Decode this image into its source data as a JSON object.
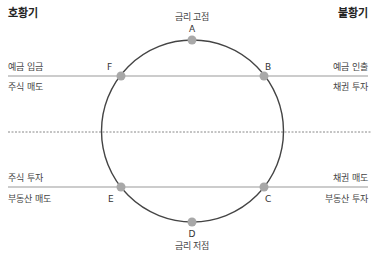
{
  "headers": {
    "left": "호황기",
    "right": "불황기"
  },
  "points": {
    "A": {
      "label": "A",
      "caption": "금리 고점"
    },
    "B": {
      "label": "B"
    },
    "C": {
      "label": "C"
    },
    "D": {
      "label": "D",
      "caption": "금리 저점"
    },
    "E": {
      "label": "E"
    },
    "F": {
      "label": "F"
    }
  },
  "upper_line": {
    "left_above": "예금 입금",
    "left_below": "주식 매도",
    "right_above": "예금 인출",
    "right_below": "채권 투자"
  },
  "lower_line": {
    "left_above": "주식 투자",
    "left_below": "부동산 매도",
    "right_above": "채권 매도",
    "right_below": "부동산 투자"
  },
  "colors": {
    "circle": "#444444",
    "lines": "#999999",
    "dashed": "#888888",
    "points": "#a8a8a8"
  }
}
